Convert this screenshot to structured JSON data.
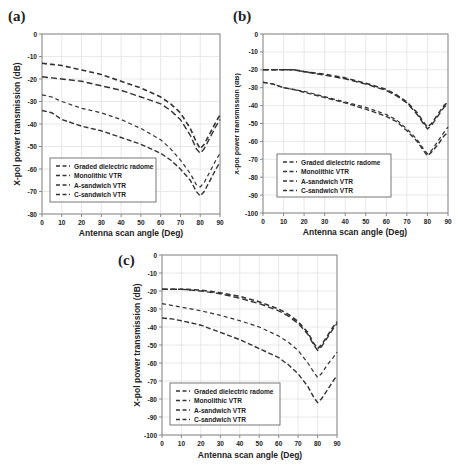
{
  "chart_data": [
    {
      "panel": "(a)",
      "type": "line",
      "title": "",
      "xlabel": "Antenna scan angle (Deg)",
      "ylabel": "X-pol power transmission (dB)",
      "xlim": [
        0,
        90
      ],
      "ylim": [
        -80,
        0
      ],
      "xticks": [
        0,
        10,
        20,
        30,
        40,
        50,
        60,
        70,
        80,
        90
      ],
      "yticks": [
        0,
        -10,
        -20,
        -30,
        -40,
        -50,
        -60,
        -70,
        -80
      ],
      "grid": true,
      "legend_position": "lower left",
      "x": [
        0,
        5,
        10,
        20,
        30,
        40,
        50,
        60,
        65,
        70,
        75,
        78,
        80,
        82,
        85,
        88,
        90
      ],
      "series": [
        {
          "name": "Graded dielectric radome",
          "values": [
            -13,
            -13.5,
            -14,
            -16,
            -18,
            -21,
            -24,
            -28,
            -31,
            -35,
            -42,
            -48,
            -51,
            -49,
            -44,
            -39,
            -36
          ]
        },
        {
          "name": "Monolithic VTR",
          "values": [
            -19,
            -19.5,
            -20,
            -21,
            -23,
            -25,
            -28,
            -31,
            -34,
            -38,
            -45,
            -51,
            -53,
            -51,
            -46,
            -41,
            -38
          ]
        },
        {
          "name": "A-sandwich VTR",
          "values": [
            -27,
            -28,
            -30,
            -33,
            -35,
            -38,
            -42,
            -47,
            -51,
            -56,
            -62,
            -67,
            -68,
            -66,
            -61,
            -56,
            -53
          ]
        },
        {
          "name": "C-sandwich VTR",
          "values": [
            -34,
            -35,
            -38,
            -41,
            -43,
            -46,
            -49,
            -53,
            -56,
            -60,
            -65,
            -70,
            -72,
            -70,
            -65,
            -60,
            -57
          ]
        }
      ]
    },
    {
      "panel": "(b)",
      "type": "line",
      "title": "",
      "xlabel": "Antenna scan angle (Deg)",
      "ylabel": "X-pol power transmission (dB)",
      "xlim": [
        0,
        90
      ],
      "ylim": [
        -100,
        0
      ],
      "xticks": [
        0,
        10,
        20,
        30,
        40,
        50,
        60,
        70,
        80,
        90
      ],
      "yticks": [
        0,
        -10,
        -20,
        -30,
        -40,
        -50,
        -60,
        -70,
        -80,
        -90,
        -100
      ],
      "grid": true,
      "legend_position": "lower left",
      "x": [
        0,
        5,
        10,
        15,
        20,
        30,
        40,
        50,
        60,
        65,
        70,
        75,
        78,
        80,
        82,
        85,
        88,
        90
      ],
      "series": [
        {
          "name": "Graded dielectric radome",
          "values": [
            -20,
            -20,
            -20,
            -20,
            -21,
            -22.5,
            -24.5,
            -27.5,
            -31,
            -34,
            -38,
            -44,
            -49,
            -52,
            -50,
            -45,
            -40,
            -38
          ]
        },
        {
          "name": "Monolithic VTR",
          "values": [
            -20,
            -20,
            -20,
            -20,
            -21,
            -23,
            -25,
            -28,
            -31.5,
            -34.5,
            -38.5,
            -45,
            -50,
            -53,
            -51,
            -46,
            -41,
            -39
          ]
        },
        {
          "name": "A-sandwich VTR",
          "values": [
            -27,
            -28,
            -30,
            -31,
            -32,
            -35,
            -38,
            -41,
            -45,
            -48,
            -53,
            -59,
            -64,
            -67,
            -65,
            -60,
            -55,
            -52
          ]
        },
        {
          "name": "C-sandwich VTR",
          "values": [
            -27,
            -28,
            -30,
            -31,
            -32.5,
            -35.5,
            -38.5,
            -42,
            -46,
            -49,
            -54,
            -60,
            -65,
            -68,
            -66,
            -62,
            -57,
            -55
          ]
        }
      ]
    },
    {
      "panel": "(c)",
      "type": "line",
      "title": "",
      "xlabel": "Antenna scan angle (Deg)",
      "ylabel": "X-pol power transmission (dB)",
      "xlim": [
        0,
        90
      ],
      "ylim": [
        -100,
        0
      ],
      "xticks": [
        0,
        10,
        20,
        30,
        40,
        50,
        60,
        70,
        80,
        90
      ],
      "yticks": [
        0,
        -10,
        -20,
        -30,
        -40,
        -50,
        -60,
        -70,
        -80,
        -90,
        -100
      ],
      "grid": true,
      "legend_position": "lower left",
      "x": [
        0,
        5,
        10,
        20,
        30,
        40,
        50,
        60,
        65,
        70,
        75,
        78,
        80,
        82,
        85,
        88,
        90
      ],
      "series": [
        {
          "name": "Graded dielectric radome",
          "values": [
            -19,
            -19,
            -19,
            -19.5,
            -21,
            -23,
            -26,
            -30,
            -33,
            -37,
            -43,
            -49,
            -52,
            -50,
            -45,
            -40,
            -37
          ]
        },
        {
          "name": "Monolithic VTR",
          "values": [
            -19,
            -19,
            -19,
            -20,
            -21.5,
            -24,
            -27,
            -31,
            -34,
            -38,
            -44,
            -50,
            -53,
            -51,
            -46,
            -41,
            -38
          ]
        },
        {
          "name": "A-sandwich VTR",
          "values": [
            -27,
            -28,
            -29,
            -31,
            -33.5,
            -36.5,
            -40,
            -45,
            -48.5,
            -53,
            -60,
            -65,
            -68,
            -66,
            -61,
            -57,
            -54
          ]
        },
        {
          "name": "C-sandwich VTR",
          "values": [
            -35,
            -35.5,
            -36.5,
            -39,
            -43,
            -47,
            -52,
            -57,
            -61,
            -66,
            -73,
            -79,
            -82,
            -80,
            -75,
            -70,
            -67
          ]
        }
      ]
    }
  ],
  "panels": [
    {
      "label": "(a)",
      "xlabel": "Antenna scan angle (Deg)",
      "ylabel": "X-pol power transmission (dB)"
    },
    {
      "label": "(b)",
      "xlabel": "Antenna scan angle (Deg)",
      "ylabel": "X-pol power transmission (dB)"
    },
    {
      "label": "(c)",
      "xlabel": "Antenna scan angle (Deg)",
      "ylabel": "X-pol power transmission (dB)"
    }
  ],
  "legend": [
    "Graded dielectric radome",
    "Monolithic VTR",
    "A-sandwich VTR",
    "C-sandwich VTR"
  ],
  "colors": {
    "line": "#333333",
    "grid": "#e2e2e2",
    "axis": "#888888",
    "text": "#222222"
  }
}
